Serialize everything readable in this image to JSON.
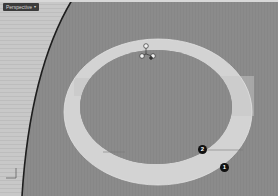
{
  "viewport": {
    "label": "Perspective",
    "label_arrow": "▾",
    "colors": {
      "background": "#8b8b8b",
      "left_panel": "#c9c9c9",
      "ring": "#d4d4d4",
      "ring_inner": "#8a8a8a",
      "edge_line": "#222222",
      "callout": "#111111"
    }
  },
  "gizmo": {
    "icon": "transform-gizmo-icon"
  },
  "axis_widget": {
    "icon": "axis-widget-icon"
  },
  "callouts": [
    {
      "number": "2"
    },
    {
      "number": "1"
    }
  ]
}
